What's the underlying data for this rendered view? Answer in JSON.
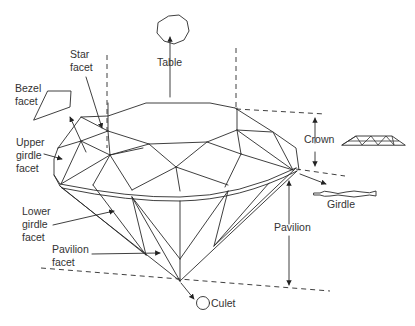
{
  "diagram": {
    "labels": {
      "table": "Table",
      "star_facet_1": "Star",
      "star_facet_2": "facet",
      "bezel_facet_1": "Bezel",
      "bezel_facet_2": "facet",
      "upper_girdle_1": "Upper",
      "upper_girdle_2": "girdle",
      "upper_girdle_3": "facet",
      "lower_girdle_1": "Lower",
      "lower_girdle_2": "girdle",
      "lower_girdle_3": "facet",
      "pavilion_facet_1": "Pavilion",
      "pavilion_facet_2": "facet",
      "crown": "Crown",
      "pavilion": "Pavilion",
      "girdle": "Girdle",
      "culet": "Culet"
    },
    "colors": {
      "line": "#2a2a2a",
      "text": "#333333",
      "background": "#ffffff"
    }
  }
}
